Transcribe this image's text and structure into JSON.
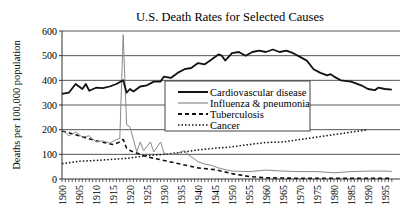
{
  "chart_data": {
    "type": "line",
    "title": "U.S. Death Rates for Selected Causes",
    "xlabel": "",
    "ylabel": "Deaths per 100,000 population",
    "ylim": [
      0,
      600
    ],
    "xlim": [
      1900,
      1997
    ],
    "yticks": [
      0,
      100,
      200,
      300,
      400,
      500,
      600
    ],
    "xticks": [
      1900,
      1905,
      1910,
      1915,
      1920,
      1925,
      1930,
      1935,
      1940,
      1945,
      1950,
      1955,
      1960,
      1965,
      1970,
      1975,
      1980,
      1985,
      1990,
      1995
    ],
    "grid": "horizontal",
    "legend_position": "center (inside plot, between 200 and 400)",
    "series": [
      {
        "name": "Cardiovascular disease",
        "style": "solid-thick",
        "x": [
          1900,
          1902,
          1904,
          1906,
          1907,
          1908,
          1910,
          1912,
          1914,
          1916,
          1918,
          1919,
          1920,
          1921,
          1923,
          1925,
          1927,
          1929,
          1930,
          1932,
          1934,
          1936,
          1938,
          1940,
          1942,
          1944,
          1946,
          1947,
          1948,
          1950,
          1952,
          1954,
          1956,
          1958,
          1960,
          1962,
          1964,
          1966,
          1968,
          1970,
          1972,
          1974,
          1976,
          1978,
          1979,
          1980,
          1982,
          1985,
          1988,
          1990,
          1992,
          1993,
          1995,
          1997
        ],
        "values": [
          345,
          350,
          385,
          365,
          385,
          358,
          370,
          368,
          375,
          385,
          400,
          350,
          365,
          355,
          375,
          380,
          395,
          395,
          415,
          410,
          430,
          445,
          450,
          470,
          465,
          485,
          505,
          500,
          480,
          510,
          515,
          500,
          515,
          520,
          515,
          525,
          515,
          520,
          510,
          495,
          480,
          445,
          430,
          420,
          425,
          415,
          400,
          395,
          380,
          365,
          360,
          370,
          365,
          362
        ]
      },
      {
        "name": "Influenza & pneumonia",
        "style": "solid-thin-gray",
        "x": [
          1900,
          1902,
          1904,
          1906,
          1908,
          1910,
          1912,
          1914,
          1916,
          1917,
          1918,
          1919,
          1920,
          1922,
          1923,
          1924,
          1926,
          1927,
          1929,
          1930,
          1932,
          1934,
          1936,
          1937,
          1940,
          1942,
          1944,
          1946,
          1948,
          1950,
          1955,
          1960,
          1965,
          1970,
          1975,
          1980,
          1985,
          1990,
          1995,
          1997
        ],
        "values": [
          200,
          175,
          190,
          170,
          175,
          150,
          155,
          145,
          160,
          165,
          585,
          220,
          210,
          110,
          150,
          115,
          150,
          110,
          150,
          105,
          100,
          105,
          115,
          100,
          70,
          60,
          55,
          45,
          38,
          32,
          30,
          36,
          32,
          30,
          30,
          25,
          30,
          32,
          32,
          31
        ]
      },
      {
        "name": "Tuberculosis",
        "style": "dashed",
        "x": [
          1900,
          1905,
          1910,
          1915,
          1917,
          1918,
          1919,
          1920,
          1925,
          1930,
          1935,
          1940,
          1945,
          1950,
          1955,
          1960,
          1970,
          1980,
          1990,
          1997
        ],
        "values": [
          195,
          175,
          155,
          140,
          150,
          160,
          125,
          115,
          90,
          75,
          60,
          45,
          38,
          22,
          10,
          5,
          3,
          3,
          3,
          3
        ]
      },
      {
        "name": "Cancer",
        "style": "dotted",
        "x": [
          1900,
          1905,
          1910,
          1915,
          1920,
          1925,
          1930,
          1935,
          1940,
          1945,
          1950,
          1955,
          1960,
          1965,
          1970,
          1975,
          1980,
          1985,
          1990
        ],
        "values": [
          62,
          72,
          75,
          80,
          85,
          95,
          100,
          108,
          118,
          125,
          130,
          140,
          148,
          150,
          160,
          170,
          180,
          190,
          200
        ]
      }
    ]
  },
  "colors": {
    "cardiovascular": "#111111",
    "influenza": "#8a8a8a",
    "tuberculosis": "#111111",
    "cancer": "#111111",
    "grid": "#555555",
    "axis": "#333333"
  }
}
